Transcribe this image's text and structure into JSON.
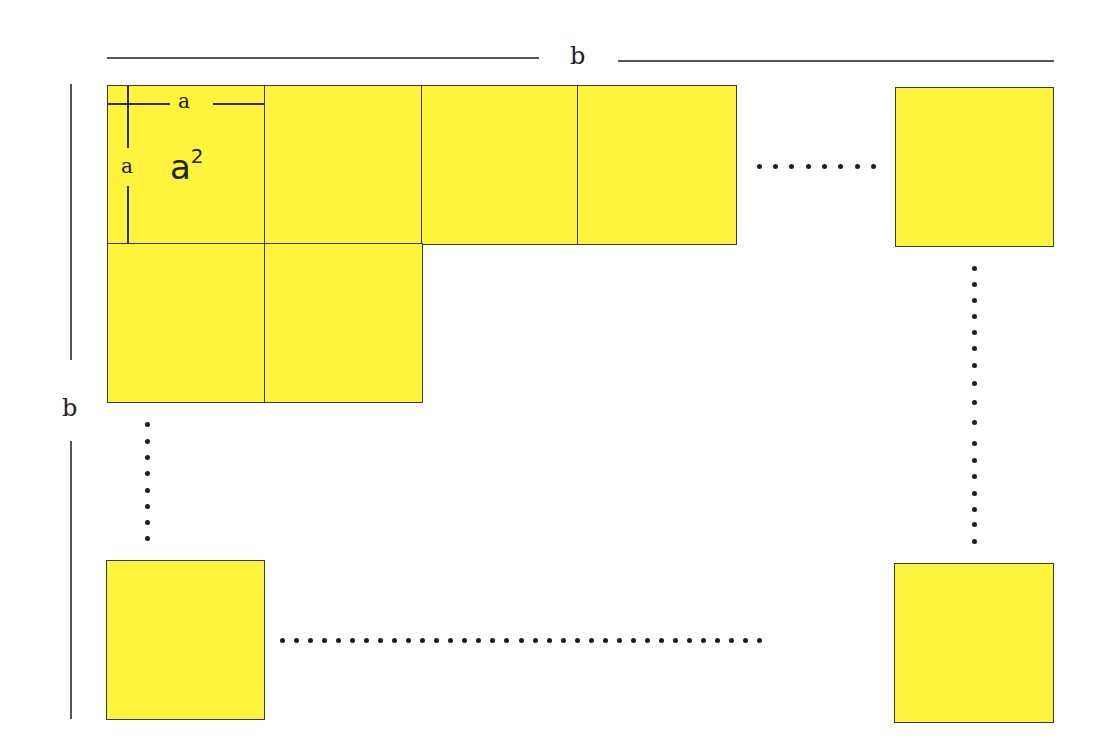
{
  "diagram": {
    "dimension_labels": {
      "top_width": "b",
      "left_height": "b"
    },
    "unit_square": {
      "side_top_label": "a",
      "side_left_label": "a",
      "area_base": "a",
      "area_exponent": "2"
    },
    "colors": {
      "square_fill": "#fff33d",
      "square_border": "#3a3a2a",
      "dimension_line": "#555555",
      "dot": "#1e1e1e",
      "background": "#ffffff"
    },
    "rows": [
      {
        "row": 1,
        "visible_squares": 4,
        "has_trailing_ellipsis": true,
        "trailing_square": true
      },
      {
        "row": 2,
        "visible_squares": 2
      },
      {
        "row": "last",
        "visible_squares": 2,
        "ellipsis_between": true
      }
    ],
    "ellipses": {
      "top_row_horizontal_dots": 8,
      "right_column_vertical_dots": 17,
      "left_column_vertical_dots": 8,
      "bottom_row_horizontal_dots": 35
    }
  }
}
